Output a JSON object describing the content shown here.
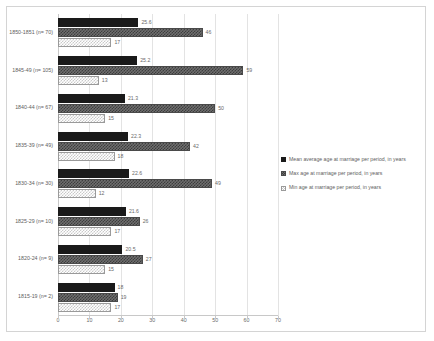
{
  "chart_data": {
    "type": "bar",
    "orientation": "horizontal",
    "title": "",
    "xlabel": "",
    "ylabel": "",
    "xlim": [
      0,
      70
    ],
    "xticks": [
      0,
      10,
      20,
      30,
      40,
      50,
      60,
      70
    ],
    "grid": true,
    "legend_position": "right",
    "categories": [
      "1850-1851 (n= 70)",
      "1845-49 (n= 105)",
      "1840-44 (n= 67)",
      "1835-39 (n= 49)",
      "1830-34 (n= 30)",
      "1825-29 (n= 10)",
      "1820-24 (n= 9)",
      "1815-19 (n= 2)"
    ],
    "series": [
      {
        "name": "Mean average age at marriage per period, in years",
        "key": "mean",
        "values": [
          25.6,
          25.2,
          21.3,
          22.3,
          22.6,
          21.6,
          20.5,
          18
        ],
        "labels": [
          "25.6",
          "25.2",
          "21.3",
          "22.3",
          "22.6",
          "21.6",
          "20.5",
          "18"
        ],
        "color": "#1a1a1a"
      },
      {
        "name": "Max age at marriage per period, in years",
        "key": "max",
        "values": [
          46,
          59,
          50,
          42,
          49,
          26,
          27,
          19
        ],
        "labels": [
          "46",
          "59",
          "50",
          "42",
          "49",
          "26",
          "27",
          "19"
        ],
        "color": "#6e6e6e"
      },
      {
        "name": "Min age at marriage per period, in years",
        "key": "min",
        "values": [
          17,
          13,
          15,
          18,
          12,
          17,
          15,
          17
        ],
        "labels": [
          "17",
          "13",
          "15",
          "18",
          "12",
          "17",
          "15",
          "17"
        ],
        "color": "#dcdcdc"
      }
    ]
  }
}
